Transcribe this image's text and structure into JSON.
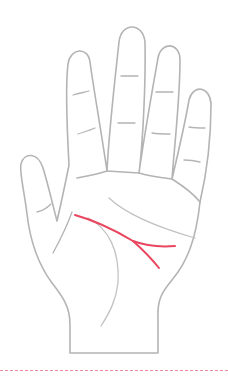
{
  "illustration": {
    "subject": "palm-diagram",
    "highlighted_line": "head-line-forked",
    "colors": {
      "outline": "#b4b4b4",
      "palm_lines": "#c2c2c2",
      "highlight": "#e8475f",
      "divider": "#f08aa0",
      "background": "#ffffff"
    }
  }
}
